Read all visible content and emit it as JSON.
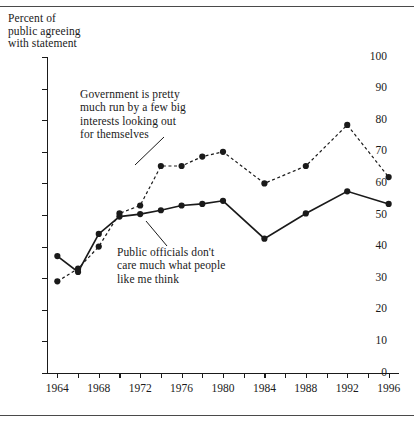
{
  "chart_data": {
    "type": "line",
    "title": "Percent of\npublic agreeing\nwith statement",
    "xlabel": "",
    "ylabel": "Percent of public agreeing with statement",
    "xlim": [
      1963,
      1997
    ],
    "ylim": [
      0,
      100
    ],
    "grid": false,
    "legend_position": "inline-annotations",
    "y_ticks": [
      0,
      10,
      20,
      30,
      40,
      50,
      60,
      70,
      80,
      90,
      100
    ],
    "y_tick_labels": [
      "0",
      "10",
      "20",
      "30",
      "40",
      "50",
      "60",
      "70",
      "80",
      "90",
      "100"
    ],
    "x_ticks": [
      1964,
      1968,
      1972,
      1976,
      1980,
      1984,
      1988,
      1992,
      1996
    ],
    "x_tick_labels": [
      "1964",
      "1968",
      "1972",
      "1976",
      "1980",
      "1984",
      "1988",
      "1992",
      "1996"
    ],
    "x_minor_ticks": [
      1966,
      1970,
      1974,
      1978,
      1982,
      1986,
      1990,
      1994
    ],
    "series": [
      {
        "name": "Government is pretty much run by a few big interests looking out for themselves",
        "style": "dashed",
        "color": "#1a1a1a",
        "x": [
          1964,
          1966,
          1968,
          1970,
          1972,
          1974,
          1976,
          1978,
          1980,
          1984,
          1988,
          1992,
          1996
        ],
        "values": [
          29,
          33,
          40,
          50.5,
          53,
          65.5,
          65.5,
          68.5,
          70,
          60,
          65.5,
          78.5,
          62
        ]
      },
      {
        "name": "Public officials don't care much what people like me think",
        "style": "solid",
        "color": "#1a1a1a",
        "x": [
          1964,
          1966,
          1968,
          1970,
          1972,
          1974,
          1976,
          1978,
          1980,
          1984,
          1988,
          1992,
          1996
        ],
        "values": [
          37,
          32,
          44,
          49.5,
          50.3,
          51.5,
          53,
          53.5,
          54.5,
          42.5,
          50.5,
          57.5,
          53.5
        ]
      }
    ],
    "annotations": [
      {
        "id": "interests",
        "text": "Government is pretty\nmuch run by a few big\ninterests looking out\nfor themselves"
      },
      {
        "id": "officials",
        "text": "Public officials don't\ncare much what people\nlike me think"
      }
    ]
  }
}
